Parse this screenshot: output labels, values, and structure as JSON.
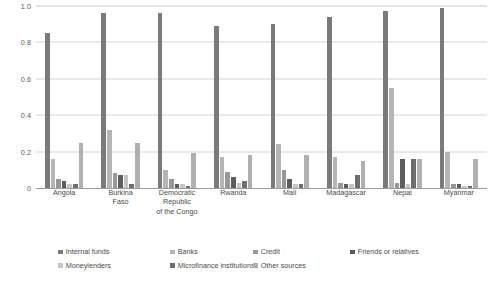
{
  "chart_data": {
    "type": "bar",
    "title": "",
    "subtitle": "",
    "xlabel": "",
    "ylabel": "",
    "ylim": [
      0,
      1.0
    ],
    "grid": true,
    "legend_position": "bottom",
    "categories": [
      "Angola",
      "Burkina\nFaso",
      "Democratic\nRepublic\nof the Congo",
      "Rwanda",
      "Mali",
      "Madagascar",
      "Nepal",
      "Myanmar"
    ],
    "y_ticks": [
      "0",
      "0.2",
      "0.4",
      "0.6",
      "0.8",
      "1.0"
    ],
    "y_tick_values": [
      0,
      0.2,
      0.4,
      0.6,
      0.8,
      1.0
    ],
    "series": [
      {
        "name": "Internal funds",
        "color": "#7a7a7a",
        "values": [
          0.85,
          0.96,
          0.96,
          0.89,
          0.9,
          0.94,
          0.97,
          0.99
        ]
      },
      {
        "name": "Banks",
        "color": "#b5b5b5",
        "values": [
          0.16,
          0.32,
          0.1,
          0.17,
          0.24,
          0.17,
          0.55,
          0.2
        ]
      },
      {
        "name": "Credit",
        "color": "#989898",
        "values": [
          0.05,
          0.08,
          0.05,
          0.09,
          0.1,
          0.03,
          0.03,
          0.02
        ]
      },
      {
        "name": "Friends or relatives",
        "color": "#5d5d5d",
        "values": [
          0.04,
          0.07,
          0.02,
          0.06,
          0.05,
          0.02,
          0.16,
          0.02
        ]
      },
      {
        "name": "Moneylenders",
        "color": "#c6c6c6",
        "values": [
          0.02,
          0.07,
          0.02,
          0.03,
          0.02,
          0.02,
          0.02,
          0.01
        ]
      },
      {
        "name": "Microfinance institutions",
        "color": "#6e6e6e",
        "values": [
          0.02,
          0.02,
          0.01,
          0.04,
          0.02,
          0.07,
          0.16,
          0.01
        ]
      },
      {
        "name": "Other sources",
        "color": "#b0b0b0",
        "values": [
          0.25,
          0.25,
          0.19,
          0.18,
          0.18,
          0.15,
          0.16,
          0.16
        ]
      }
    ]
  },
  "legend": {
    "rows": [
      [
        "Internal funds",
        "Banks",
        "Credit",
        "Friends or relatives"
      ],
      [
        "Moneylenders",
        "Microfinance institutions",
        "Other sources"
      ]
    ]
  }
}
